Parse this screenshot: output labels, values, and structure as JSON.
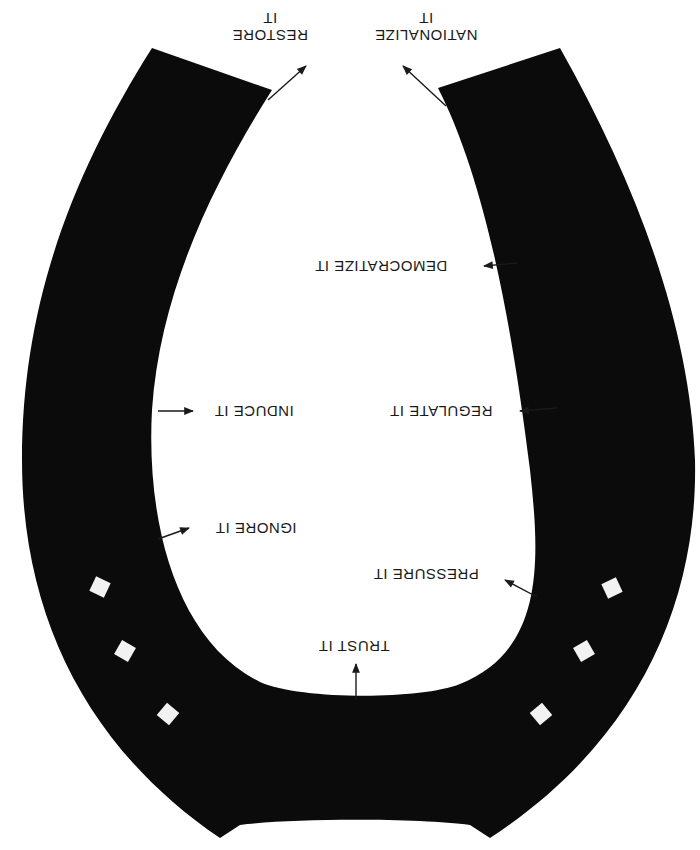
{
  "diagram": {
    "type": "horseshoe-spectrum",
    "orientation": "rotated-180",
    "colors": {
      "shoe": "#0b0b0b",
      "background": "#ffffff",
      "nail_hole": "#f2f2f2",
      "text": "#1a1a1a",
      "arrow": "#1a1a1a"
    },
    "labels": {
      "restore": {
        "line1": "RESTORE",
        "line2": "IT"
      },
      "nationalize": {
        "line1": "NATIONALIZE",
        "line2": "IT"
      },
      "democratize": {
        "text": "DEMOCRATIZE IT"
      },
      "induce": {
        "text": "INDUCE IT"
      },
      "regulate": {
        "text": "REGULATE IT"
      },
      "ignore": {
        "text": "IGNORE IT"
      },
      "pressure": {
        "text": "PRESSURE IT"
      },
      "trust": {
        "text": "TRUST IT"
      }
    },
    "nail_holes": {
      "left": 3,
      "right": 3
    }
  }
}
